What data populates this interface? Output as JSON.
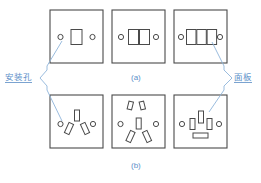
{
  "figure": {
    "title_a": "(a)",
    "title_b": "(b)",
    "label_left": "安装孔",
    "label_right": "面板",
    "colors": {
      "annotation": "#5b8fc9",
      "outline": "#4a4a4a",
      "leader": "#8fb4da",
      "panel_fill": "#ffffff"
    },
    "rows": [
      {
        "id": "row-a",
        "caption": "(a)",
        "panels": [
          {
            "name": "single-gang-switch-panel",
            "mounting_holes": 2,
            "openings": 1,
            "opening_type": "rectangular-rocker"
          },
          {
            "name": "double-gang-switch-panel",
            "mounting_holes": 2,
            "openings": 2,
            "opening_type": "rectangular-rocker"
          },
          {
            "name": "triple-gang-switch-panel",
            "mounting_holes": 2,
            "openings": 3,
            "opening_type": "rectangular-rocker"
          }
        ]
      },
      {
        "id": "row-b",
        "caption": "(b)",
        "panels": [
          {
            "name": "three-pin-socket-panel",
            "mounting_holes": 2,
            "openings": 3,
            "opening_type": "angled-pin-slots"
          },
          {
            "name": "five-pin-socket-panel",
            "mounting_holes": 2,
            "openings": 5,
            "opening_type": "two-pin-plus-three-pin-slots"
          },
          {
            "name": "combination-socket-panel",
            "mounting_holes": 2,
            "openings": 4,
            "opening_type": "vertical-slots-plus-horizontal-slot"
          }
        ]
      }
    ]
  }
}
